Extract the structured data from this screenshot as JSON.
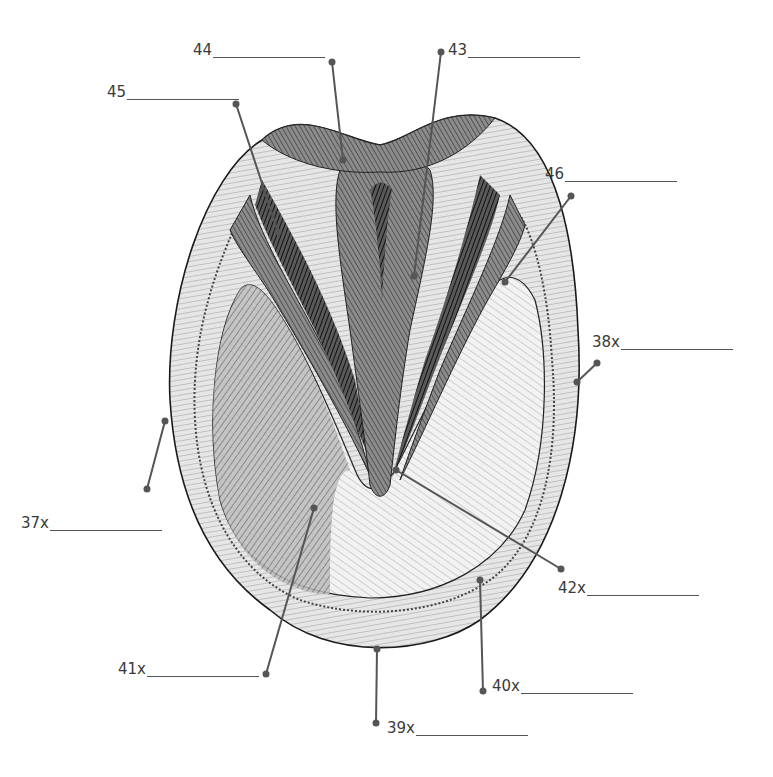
{
  "diagram": {
    "colors": {
      "leader": "#555555",
      "ink": "#1a1a1a",
      "label_text": "#3a3a3a",
      "background": "#ffffff"
    },
    "labels": [
      {
        "id": "44",
        "text": "44",
        "x": 193,
        "y": 42,
        "blank_width": 112,
        "pointer": [
          332,
          62
        ],
        "target": [
          343,
          160
        ]
      },
      {
        "id": "45",
        "text": "45",
        "x": 107,
        "y": 84,
        "blank_width": 112,
        "pointer": [
          236,
          104
        ],
        "target": [
          278,
          232
        ]
      },
      {
        "id": "43",
        "text": "43",
        "x": 448,
        "y": 42,
        "blank_width": 112,
        "pointer": [
          441,
          52
        ],
        "target": [
          414,
          276
        ]
      },
      {
        "id": "46",
        "text": "46",
        "x": 545,
        "y": 166,
        "blank_width": 112,
        "pointer": [
          571,
          196
        ],
        "target": [
          505,
          282
        ]
      },
      {
        "id": "38x",
        "text": "38x",
        "x": 592,
        "y": 334,
        "blank_width": 112,
        "pointer": [
          597,
          363
        ],
        "target": [
          577,
          382
        ]
      },
      {
        "id": "37x",
        "text": "37x",
        "x": 21,
        "y": 515,
        "blank_width": 112,
        "pointer": [
          147,
          489
        ],
        "target": [
          165,
          421
        ]
      },
      {
        "id": "42x",
        "text": "42x",
        "x": 558,
        "y": 580,
        "blank_width": 112,
        "pointer": [
          561,
          569
        ],
        "target": [
          396,
          470
        ]
      },
      {
        "id": "41x",
        "text": "41x",
        "x": 118,
        "y": 661,
        "blank_width": 112,
        "pointer": [
          266,
          674
        ],
        "target": [
          314,
          508
        ]
      },
      {
        "id": "40x",
        "text": "40x",
        "x": 492,
        "y": 678,
        "blank_width": 112,
        "pointer": [
          483,
          691
        ],
        "target": [
          480,
          580
        ]
      },
      {
        "id": "39x",
        "text": "39x",
        "x": 387,
        "y": 720,
        "blank_width": 112,
        "pointer": [
          376,
          723
        ],
        "target": [
          377,
          649
        ]
      }
    ]
  }
}
